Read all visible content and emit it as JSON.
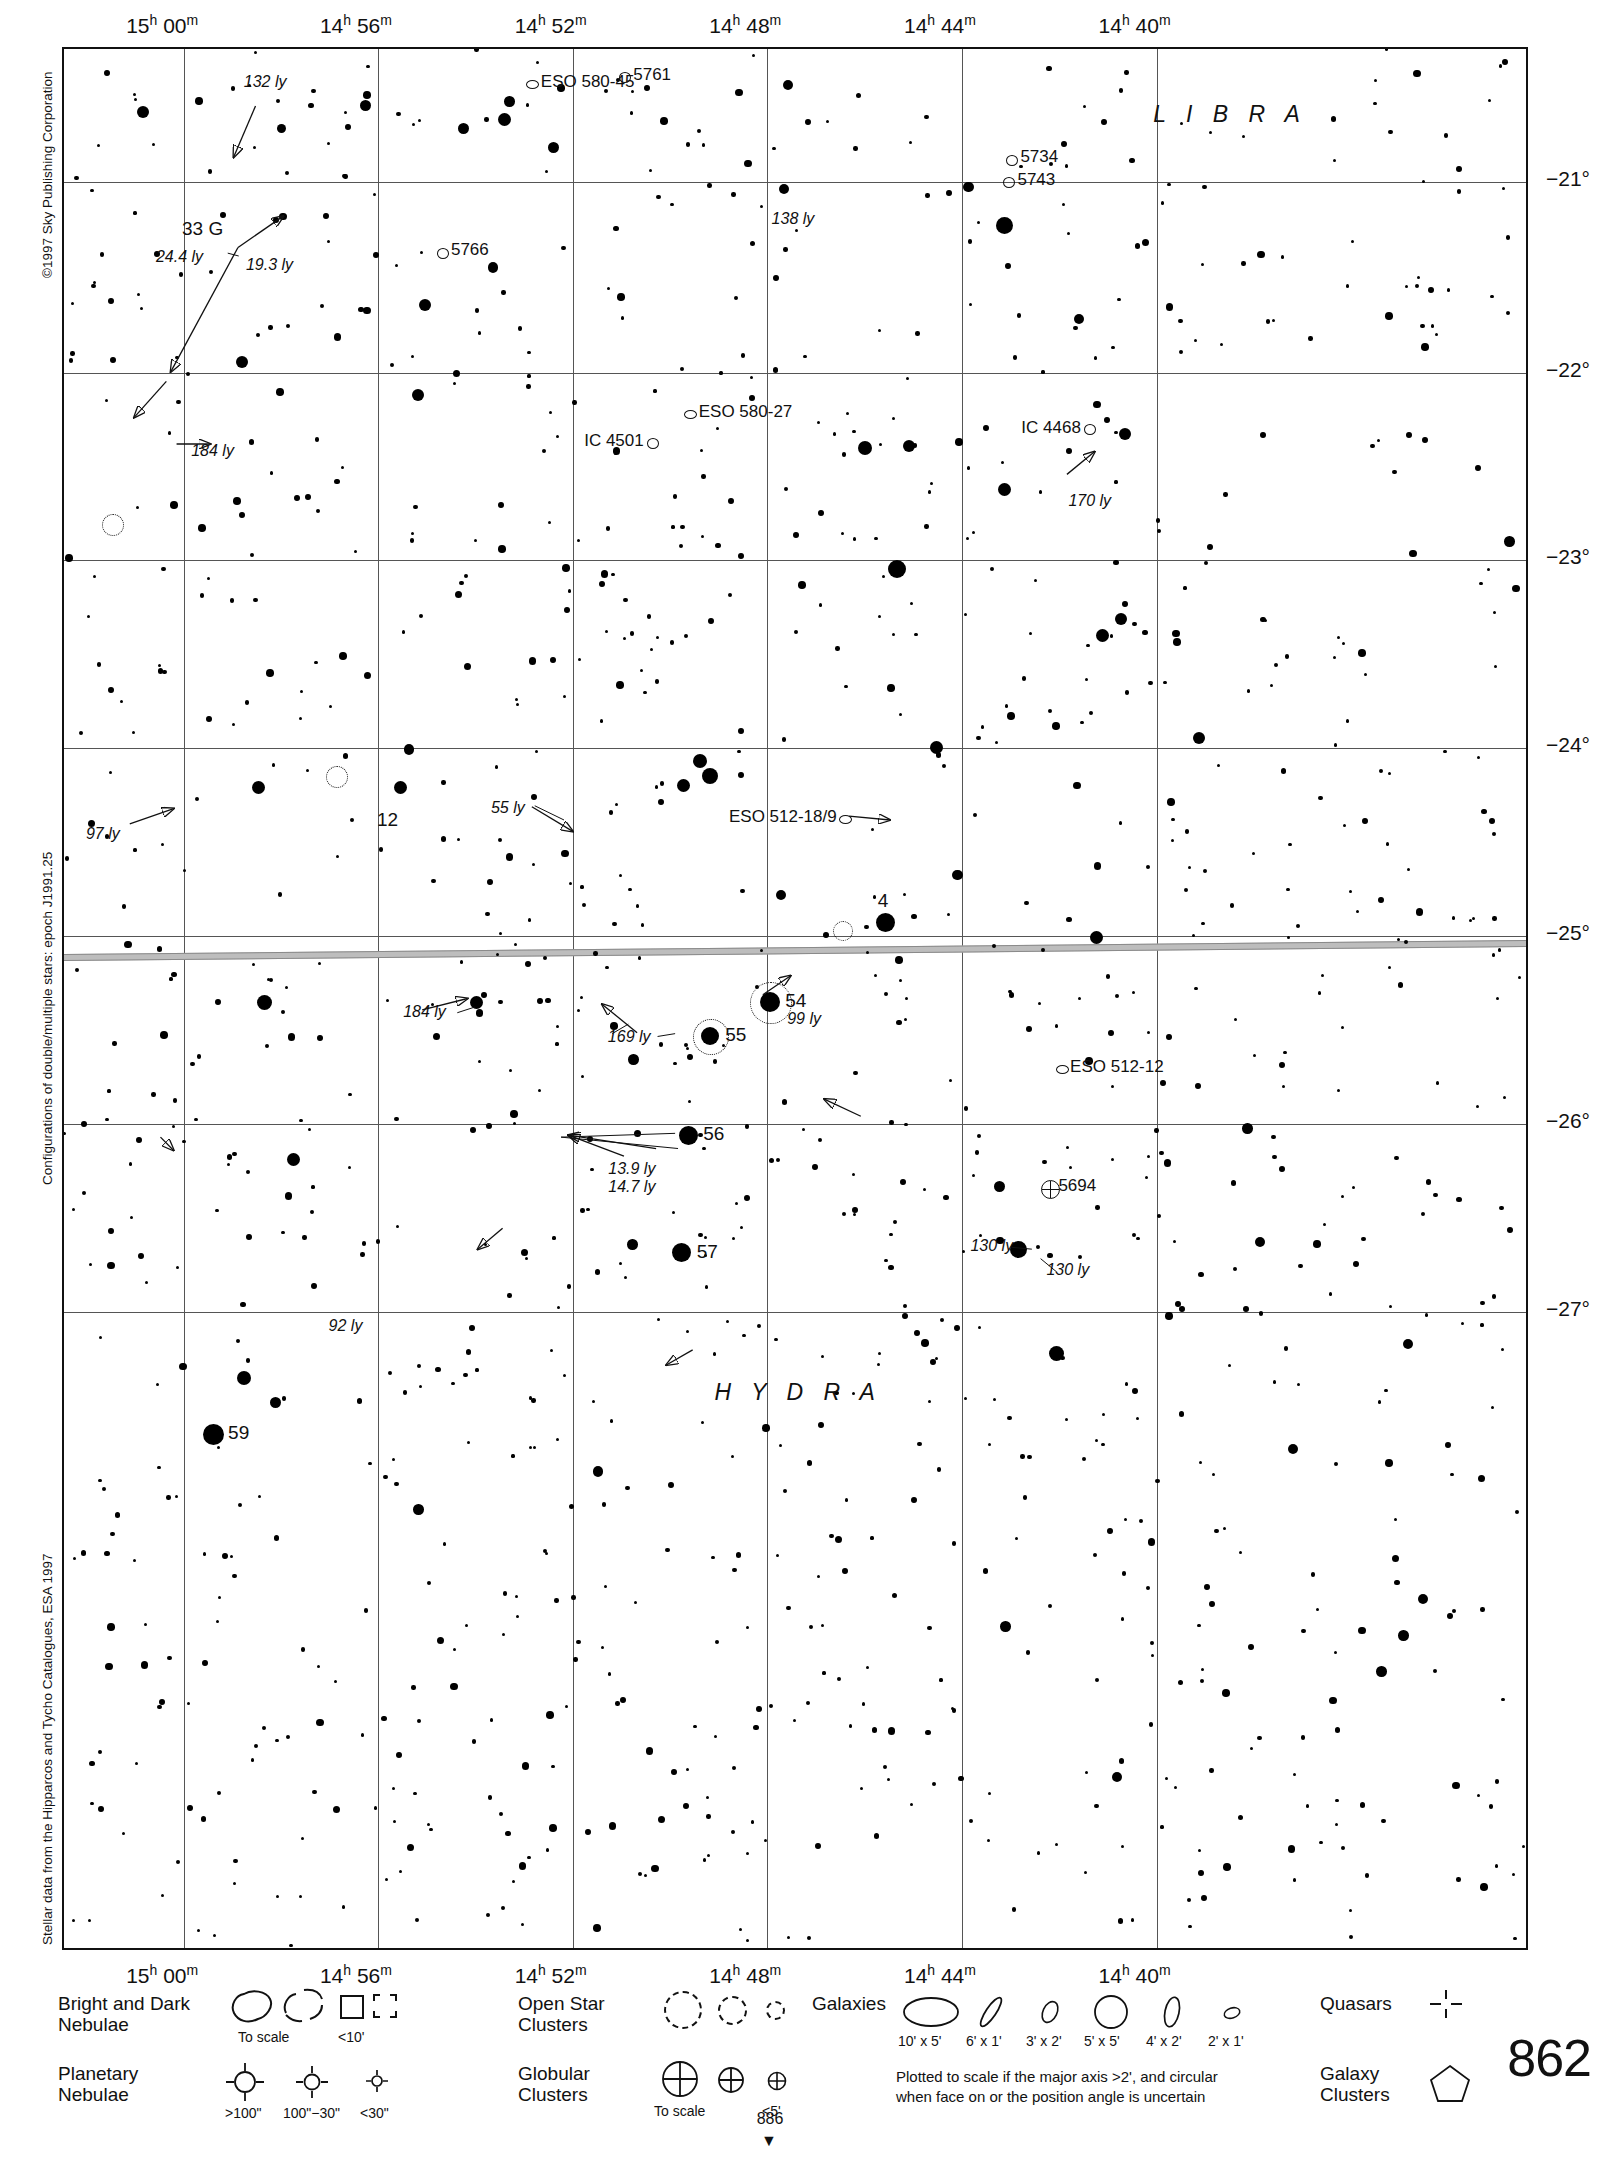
{
  "page": {
    "number": "862",
    "continue_number": "886",
    "continue_arrow": "▼"
  },
  "credits": {
    "copyright": "©1997 Sky Publishing Corporation",
    "double_star_note": "Configurations of double/multiple stars: epoch J1991.25",
    "data_source": "Stellar data from the Hipparcos and Tycho Catalogues, ESA 1997"
  },
  "axes": {
    "ra_top": [
      {
        "label": "15h 00m",
        "h": "15",
        "m": "00",
        "x": 0.0822
      },
      {
        "label": "14h 56m",
        "h": "14",
        "m": "56",
        "x": 0.2147
      },
      {
        "label": "14h 52m",
        "h": "14",
        "m": "52",
        "x": 0.3479
      },
      {
        "label": "14h 48m",
        "h": "14",
        "m": "48",
        "x": 0.481
      },
      {
        "label": "14h 44m",
        "h": "14",
        "m": "44",
        "x": 0.6142
      },
      {
        "label": "14h 40m",
        "h": "14",
        "m": "40",
        "x": 0.7473
      }
    ],
    "ra_bottom": [
      {
        "label": "15h 00m",
        "h": "15",
        "m": "00",
        "x": 0.0822
      },
      {
        "label": "14h 56m",
        "h": "14",
        "m": "56",
        "x": 0.2147
      },
      {
        "label": "14h 52m",
        "h": "14",
        "m": "52",
        "x": 0.3479
      },
      {
        "label": "14h 48m",
        "h": "14",
        "m": "48",
        "x": 0.481
      },
      {
        "label": "14h 44m",
        "h": "14",
        "m": "44",
        "x": 0.6142
      },
      {
        "label": "14h 40m",
        "h": "14",
        "m": "40",
        "x": 0.7473
      }
    ],
    "dec_right": [
      {
        "label": "−21°",
        "y": 0.07
      },
      {
        "label": "−22°",
        "y": 0.1705
      },
      {
        "label": "−23°",
        "y": 0.269
      },
      {
        "label": "−24°",
        "y": 0.368
      },
      {
        "label": "−25°",
        "y": 0.4672
      },
      {
        "label": "−26°",
        "y": 0.5662
      },
      {
        "label": "−27°",
        "y": 0.665
      }
    ]
  },
  "constellations": [
    {
      "name": "L I B R A",
      "x": 0.745,
      "y": 0.0272
    },
    {
      "name": "H Y D R A",
      "x": 0.445,
      "y": 0.7005
    }
  ],
  "chart_data": {
    "type": "scatter",
    "xlabel": "Right Ascension (J2000)",
    "ylabel": "Declination (J2000)",
    "xlim": [
      "15h 02m",
      "14h 38m"
    ],
    "ylim": [
      -27.4,
      -20.5
    ],
    "grid": true,
    "ecliptic": true,
    "deep_sky_labels": [
      {
        "name": "ESO 580-45",
        "type": "galaxy",
        "x": 0.32,
        "y": 0.0183
      },
      {
        "name": "5761",
        "type": "galaxy",
        "x": 0.3832,
        "y": 0.0146
      },
      {
        "name": "5734",
        "type": "galaxy",
        "x": 0.648,
        "y": 0.058
      },
      {
        "name": "5743",
        "type": "galaxy",
        "x": 0.646,
        "y": 0.07
      },
      {
        "name": "5766",
        "type": "galaxy",
        "x": 0.2585,
        "y": 0.107
      },
      {
        "name": "ESO 580-27",
        "type": "galaxy",
        "x": 0.428,
        "y": 0.192
      },
      {
        "name": "IC 4501",
        "type": "galaxy",
        "x": 0.402,
        "y": 0.207
      },
      {
        "name": "IC 4468",
        "type": "galaxy",
        "x": 0.701,
        "y": 0.2
      },
      {
        "name": "ESO 512-18/9",
        "type": "galaxy",
        "x": 0.534,
        "y": 0.405
      },
      {
        "name": "ESO 512-12",
        "type": "galaxy",
        "x": 0.682,
        "y": 0.537
      },
      {
        "name": "5694",
        "type": "globular",
        "x": 0.674,
        "y": 0.6
      }
    ],
    "flamsteed_stars": [
      {
        "name": "33 G",
        "x": 0.119,
        "y": 0.1045,
        "extra": [
          "24.4 ly",
          "19.3 ly"
        ]
      },
      {
        "name": "12",
        "x": 0.2195,
        "y": 0.4175
      },
      {
        "name": "4",
        "x": 0.562,
        "y": 0.46
      },
      {
        "name": "54",
        "x": 0.483,
        "y": 0.502,
        "extra": [
          "99 ly"
        ]
      },
      {
        "name": "55",
        "x": 0.442,
        "y": 0.5195
      },
      {
        "name": "56",
        "x": 0.427,
        "y": 0.572,
        "extra": [
          "13.9 ly",
          "14.7 ly"
        ]
      },
      {
        "name": "57",
        "x": 0.4225,
        "y": 0.634
      },
      {
        "name": "59",
        "x": 0.102,
        "y": 0.7295
      }
    ],
    "distance_labels": [
      {
        "text": "132 ly",
        "x": 0.123,
        "y": 0.013
      },
      {
        "text": "138 ly",
        "x": 0.484,
        "y": 0.0855
      },
      {
        "text": "184 ly",
        "x": 0.087,
        "y": 0.2075
      },
      {
        "text": "170 ly",
        "x": 0.687,
        "y": 0.234
      },
      {
        "text": "97 ly",
        "x": 0.015,
        "y": 0.409
      },
      {
        "text": "55 ly",
        "x": 0.292,
        "y": 0.3955
      },
      {
        "text": "184 ly",
        "x": 0.232,
        "y": 0.503
      },
      {
        "text": "169 ly",
        "x": 0.372,
        "y": 0.516
      },
      {
        "text": "92 ly",
        "x": 0.181,
        "y": 0.6685
      },
      {
        "text": "130 ly",
        "x": 0.62,
        "y": 0.626
      },
      {
        "text": "130 ly",
        "x": 0.672,
        "y": 0.639
      }
    ]
  },
  "legend": {
    "rows": [
      {
        "label": "Bright and Dark\nNebulae",
        "label_line1": "Bright and Dark",
        "label_line2": "Nebulae",
        "sublabels": [
          "To scale",
          "<10'"
        ]
      },
      {
        "label_line1": "Planetary",
        "label_line2": "Nebulae",
        "sublabels": [
          ">100\"",
          "100\"−30\"",
          "<30\""
        ]
      },
      {
        "label_line1": "Open Star",
        "label_line2": "Clusters",
        "sublabels": []
      },
      {
        "label_line1": "Globular",
        "label_line2": "Clusters",
        "sublabels": [
          "To scale",
          "<5'"
        ]
      },
      {
        "label_line1": "Galaxies",
        "label_line2": "",
        "sublabels": [
          "10' x 5'",
          "6' x 1'",
          "3' x 2'",
          "5' x 5'",
          "4' x 2'",
          "2' x 1'"
        ]
      },
      {
        "label_line1": "Quasars",
        "label_line2": "",
        "sublabels": []
      },
      {
        "label_line1": "Galaxy",
        "label_line2": "Clusters",
        "sublabels": []
      }
    ],
    "galaxy_note_line1": "Plotted to scale if the major axis >2', and circular",
    "galaxy_note_line2": "when face on or the position angle is uncertain"
  }
}
